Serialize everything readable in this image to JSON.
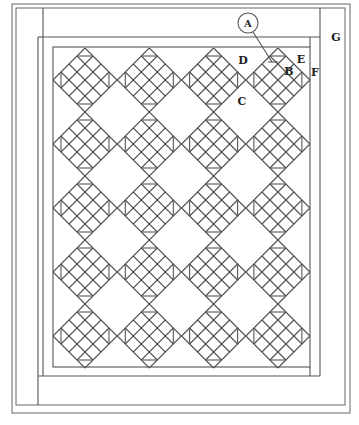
{
  "diagram": {
    "layout": {
      "columns": 4,
      "rows": 5,
      "block_style": "on-point nine-patch variation with half-square triangles",
      "line_color": "#555555",
      "background": "#ffffff"
    },
    "labels": {
      "A": "A",
      "B": "B",
      "C": "C",
      "D": "D",
      "E": "E",
      "F": "F",
      "G": "G"
    },
    "label_descriptions": {
      "A": "circled callout with leader line to pieced block",
      "B": "pieced block",
      "C": "setting square",
      "D": "setting triangle",
      "E": "corner triangle",
      "F": "inner border",
      "G": "outer border"
    }
  }
}
